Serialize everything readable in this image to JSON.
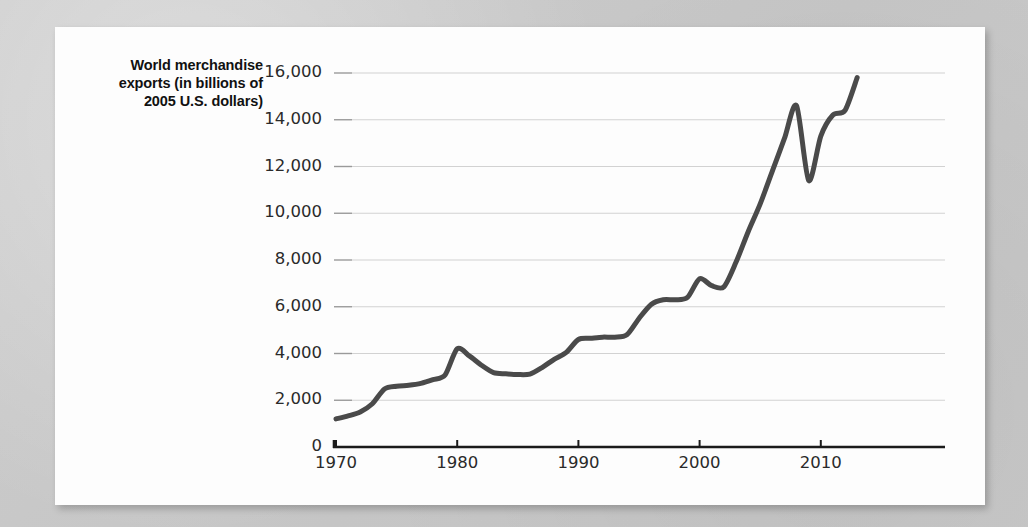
{
  "chart_data": {
    "type": "line",
    "title_lines": [
      "World merchandise",
      "exports (in billions of",
      "2005 U.S. dollars)"
    ],
    "xlabel": "",
    "ylabel": "World merchandise exports (in billions of 2005 U.S. dollars)",
    "xlim": [
      1970,
      2013
    ],
    "ylim": [
      0,
      16000
    ],
    "y_ticks": [
      0,
      2000,
      4000,
      6000,
      8000,
      10000,
      12000,
      14000,
      16000
    ],
    "y_tick_labels": [
      "0",
      "2,000",
      "4,000",
      "6,000",
      "8,000",
      "10,000",
      "12,000",
      "14,000",
      "16,000"
    ],
    "x_ticks": [
      1970,
      1980,
      1990,
      2000,
      2010
    ],
    "x_tick_labels": [
      "1970",
      "1980",
      "1990",
      "2000",
      "2010"
    ],
    "grid": "horizontal",
    "legend": null,
    "line_color": "#4a4a4a",
    "line_width": 5,
    "series": [
      {
        "name": "World merchandise exports",
        "x": [
          1970,
          1971,
          1972,
          1973,
          1974,
          1975,
          1976,
          1977,
          1978,
          1979,
          1980,
          1981,
          1982,
          1983,
          1984,
          1985,
          1986,
          1987,
          1988,
          1989,
          1990,
          1991,
          1992,
          1993,
          1994,
          1995,
          1996,
          1997,
          1998,
          1999,
          2000,
          2001,
          2002,
          2003,
          2004,
          2005,
          2006,
          2007,
          2008,
          2009,
          2010,
          2011,
          2012,
          2013
        ],
        "values": [
          1200,
          1330,
          1500,
          1850,
          2480,
          2600,
          2640,
          2720,
          2880,
          3080,
          4200,
          3900,
          3500,
          3180,
          3130,
          3100,
          3120,
          3400,
          3750,
          4050,
          4600,
          4650,
          4700,
          4700,
          4800,
          5500,
          6100,
          6300,
          6300,
          6400,
          7200,
          6900,
          6850,
          7900,
          9200,
          10400,
          11800,
          13200,
          14600,
          11400,
          13300,
          14200,
          14400,
          15800
        ]
      }
    ]
  }
}
